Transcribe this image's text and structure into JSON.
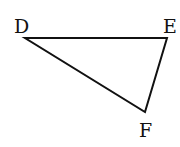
{
  "diagram": {
    "type": "triangle",
    "stroke_color": "#111111",
    "vertices": [
      {
        "label": "D",
        "x": 25,
        "y": 38,
        "label_x": 14,
        "label_y": 33
      },
      {
        "label": "E",
        "x": 167,
        "y": 38,
        "label_x": 163,
        "label_y": 33
      },
      {
        "label": "F",
        "x": 145,
        "y": 112,
        "label_x": 139,
        "label_y": 137
      }
    ],
    "edges": [
      {
        "from": "D",
        "to": "E"
      },
      {
        "from": "E",
        "to": "F"
      },
      {
        "from": "F",
        "to": "D"
      }
    ]
  }
}
